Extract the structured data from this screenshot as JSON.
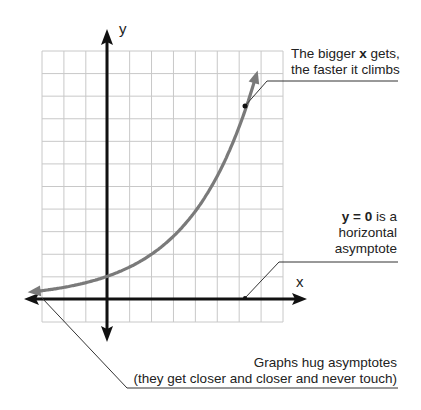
{
  "diagram": {
    "type": "exponential-growth-graph",
    "axes": {
      "x_label": "x",
      "y_label": "y"
    },
    "grid": {
      "columns": 11,
      "rows": 12,
      "color": "#c8c8c8"
    },
    "curve": {
      "function": "y = 1.4^x",
      "color": "#7a7a7a",
      "y_intercept": 1
    },
    "colors": {
      "axis": "#111111",
      "callout": "#333333",
      "text": "#222222"
    }
  },
  "callouts": {
    "growth": {
      "line1_pre": "The bigger ",
      "line1_bold": "x",
      "line1_post": " gets,",
      "line2": "the faster it climbs"
    },
    "asymptote": {
      "line1_bold": "y = 0",
      "line1_post": " is a",
      "line2": "horizontal",
      "line3": "asymptote"
    },
    "hug": {
      "line1": "Graphs hug asymptotes",
      "line2": "(they get closer and closer and never touch)"
    }
  },
  "chart_data": {
    "type": "line",
    "title": "",
    "xlabel": "x",
    "ylabel": "y",
    "series": [
      {
        "name": "exponential curve",
        "x": [
          -3.5,
          -2,
          -1,
          0,
          1,
          2,
          3,
          4,
          5,
          5.5,
          6.3,
          6.8
        ],
        "y": [
          0.31,
          0.51,
          0.71,
          1.0,
          1.4,
          1.96,
          2.74,
          3.84,
          5.38,
          6.4,
          8.4,
          10.5
        ]
      }
    ],
    "xlim": [
      -3,
      8
    ],
    "ylim": [
      -1,
      11
    ],
    "grid": true,
    "annotations": [
      "The bigger x gets, the faster it climbs",
      "y = 0 is a horizontal asymptote",
      "Graphs hug asymptotes (they get closer and closer and never touch)"
    ]
  }
}
